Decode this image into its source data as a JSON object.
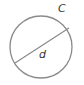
{
  "diagram": {
    "title": "",
    "shape": "circle",
    "labels": {
      "circumference": "C",
      "diameter": "d"
    },
    "colors": {
      "stroke": "#8a8a8a",
      "text": "#333333",
      "background": "#ffffff"
    }
  }
}
